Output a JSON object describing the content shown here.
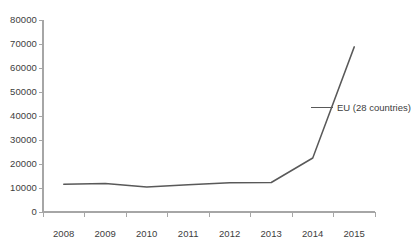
{
  "chart_data": {
    "type": "line",
    "title": "",
    "subtitle": "",
    "xlabel": "",
    "ylabel": "",
    "categories": [
      "2008",
      "2009",
      "2010",
      "2011",
      "2012",
      "2013",
      "2014",
      "2015"
    ],
    "series": [
      {
        "name": "EU (28 countries)",
        "color": "#595959",
        "values": [
          11600,
          11900,
          10400,
          11400,
          12200,
          12300,
          22500,
          68800
        ]
      }
    ],
    "ylim": [
      0,
      80000
    ],
    "yticks": [
      0,
      10000,
      20000,
      30000,
      40000,
      50000,
      60000,
      70000,
      80000
    ],
    "ytick_labels": [
      "0",
      "10000",
      "20000",
      "30000",
      "40000",
      "50000",
      "60000",
      "70000",
      "80000"
    ],
    "xtick_labels": [
      "2008",
      "2009",
      "2010",
      "2011",
      "2012",
      "2013",
      "2014",
      "2015"
    ],
    "grid": false,
    "legend": [
      "EU (28 countries)"
    ],
    "legend_position": "right",
    "annotations": []
  },
  "axes": {
    "y_axis_color": "#a6a6a6",
    "x_axis_color": "#a6a6a6",
    "tick_color": "#a6a6a6",
    "label_color": "#3d3d3d"
  },
  "legend": {
    "entries": [
      {
        "label": "EU (28 countries)",
        "color": "#595959"
      }
    ]
  }
}
